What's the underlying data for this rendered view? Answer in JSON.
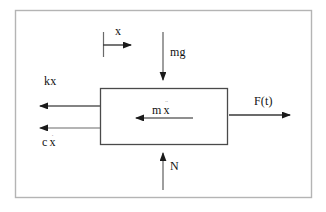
{
  "diagram": {
    "type": "free-body-diagram",
    "colors": {
      "background": "#ffffff",
      "stroke": "#3a3a3a",
      "frame": "#b4b4b4",
      "text": "#111111",
      "accent_faint": "#9a9a9a"
    },
    "frame": {
      "x": 15,
      "y": 10,
      "width": 297,
      "height": 188
    },
    "body": {
      "label": "mass-block",
      "x": 100,
      "y": 88,
      "width": 128,
      "height": 57
    },
    "labels": {
      "displacement": "x",
      "spring_force": "kx",
      "damper_force_symbol": "c",
      "damper_force_var": "x",
      "damper_force_full": "c x",
      "inertia_symbol": "m",
      "inertia_var": "x",
      "inertia_full": "m x",
      "weight": "mg",
      "normal_force": "N",
      "applied_force": "F(t)",
      "dot_single": "·",
      "dot_double": "¨"
    },
    "arrows": [
      {
        "name": "displacement-reference-arrow",
        "label": "x",
        "direction": "right",
        "x1": 103,
        "y1": 45,
        "x2": 138,
        "y2": 45
      },
      {
        "name": "weight-arrow",
        "label": "mg",
        "direction": "down",
        "x1": 163,
        "y1": 32,
        "x2": 163,
        "y2": 87
      },
      {
        "name": "spring-force-arrow",
        "label": "kx",
        "direction": "left",
        "x1": 100,
        "y1": 106,
        "x2": 32,
        "y2": 106
      },
      {
        "name": "damper-force-arrow",
        "label": "c x",
        "direction": "left",
        "x1": 100,
        "y1": 128,
        "x2": 32,
        "y2": 128
      },
      {
        "name": "inertia-force-arrow",
        "label": "m x",
        "direction": "left",
        "x1": 193,
        "y1": 118,
        "x2": 128,
        "y2": 118
      },
      {
        "name": "applied-force-arrow",
        "label": "F(t)",
        "direction": "right",
        "x1": 229,
        "y1": 115,
        "x2": 297,
        "y2": 115
      },
      {
        "name": "normal-force-arrow",
        "label": "N",
        "direction": "up",
        "x1": 163,
        "y1": 190,
        "x2": 163,
        "y2": 146
      }
    ]
  }
}
